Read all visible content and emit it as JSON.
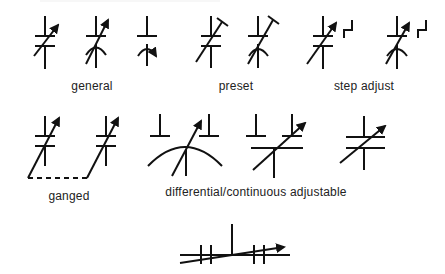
{
  "diagram": {
    "groups": [
      {
        "id": "general",
        "label": "general",
        "symbol_count": 3
      },
      {
        "id": "preset",
        "label": "preset",
        "symbol_count": 2
      },
      {
        "id": "step-adjust",
        "label": "step adjust",
        "symbol_count": 2
      },
      {
        "id": "ganged",
        "label": "ganged",
        "symbol_count": 2
      },
      {
        "id": "differential",
        "label": "differential/continuous adjustable",
        "symbol_count": 3
      },
      {
        "id": "split-stator",
        "label": "",
        "symbol_count": 1
      }
    ],
    "colors": {
      "ink": "#111111",
      "background": "#ffffff"
    }
  }
}
